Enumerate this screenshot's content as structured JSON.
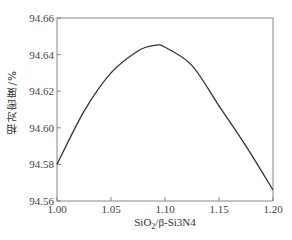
{
  "chart_data": {
    "type": "line",
    "title": "",
    "xlabel": "SiO2/β-Si3N4",
    "xlabel_parts": {
      "a": "SiO",
      "sub1": "2",
      "b": "/β-Si",
      "c": "3",
      "d": "N",
      "e": "4"
    },
    "ylabel": "相对密度/%",
    "xlim": [
      1.0,
      1.2
    ],
    "ylim": [
      94.56,
      94.66
    ],
    "xticks": [
      "1.00",
      "1.05",
      "1.10",
      "1.15",
      "1.20"
    ],
    "yticks": [
      "94.56",
      "94.58",
      "94.60",
      "94.62",
      "94.64",
      "94.66"
    ],
    "grid": false,
    "legend": null,
    "series": [
      {
        "name": "relative density",
        "x": [
          1.0,
          1.025,
          1.05,
          1.075,
          1.09,
          1.1,
          1.125,
          1.15,
          1.175,
          1.2
        ],
        "y": [
          94.58,
          94.609,
          94.63,
          94.642,
          94.645,
          94.644,
          94.634,
          94.612,
          94.59,
          94.566
        ]
      }
    ]
  }
}
